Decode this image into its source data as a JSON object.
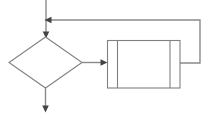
{
  "diagram": {
    "type": "flowchart",
    "canvas": {
      "width": 217,
      "height": 119,
      "background": "#ffffff"
    },
    "colors": {
      "shape_stroke": "#808080",
      "shape_fill": "#ffffff",
      "connector_stroke": "#8a8a8a",
      "arrowhead_fill": "#444444"
    },
    "nodes": [
      {
        "id": "decision",
        "shape": "diamond",
        "label": "",
        "x": 8,
        "y": 37,
        "width": 74,
        "height": 51
      },
      {
        "id": "predefined-process",
        "shape": "predefined-process",
        "label": "",
        "x": 107,
        "y": 40,
        "width": 73,
        "height": 48,
        "inner_line_left_x": 117,
        "inner_line_right_x": 170
      }
    ],
    "connectors": [
      {
        "id": "entry-arrow",
        "label": "",
        "from": "top-edge",
        "to": "decision",
        "path": "M46,0 L46,35",
        "arrowhead": "down",
        "arrow_x": 46,
        "arrow_y": 37
      },
      {
        "id": "decision-to-process",
        "label": "",
        "from": "decision",
        "to": "predefined-process",
        "path": "M82,62 L103,62",
        "arrowhead": "right",
        "arrow_x": 107,
        "arrow_y": 62
      },
      {
        "id": "feedback-loop",
        "label": "",
        "from": "predefined-process",
        "to": "entry-arrow",
        "path": "M180,63 L200,63 L200,20 L50,20",
        "arrowhead": "left",
        "arrow_x": 45,
        "arrow_y": 20
      },
      {
        "id": "exit-arrow",
        "label": "",
        "from": "decision",
        "to": "bottom-edge",
        "path": "M46,88 L46,108",
        "arrowhead": "down",
        "arrow_x": 46,
        "arrow_y": 112
      }
    ]
  }
}
